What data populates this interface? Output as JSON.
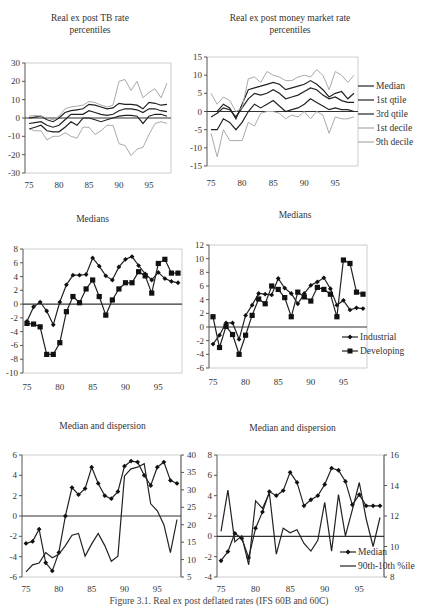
{
  "caption": "Figure 3.1.  Real ex post deflated rates (IFS 60B and 60C)",
  "chart_data": [
    {
      "id": "tb_percentiles",
      "type": "line",
      "title": "Real ex post TB rate percentiles",
      "title_lines": [
        "Real ex post TB rate",
        "percentiles"
      ],
      "x": [
        75,
        76,
        77,
        78,
        79,
        80,
        81,
        82,
        83,
        84,
        85,
        86,
        87,
        88,
        89,
        90,
        91,
        92,
        93,
        94,
        95,
        96,
        97,
        98
      ],
      "xticks": [
        75,
        80,
        85,
        90,
        95
      ],
      "yticks": [
        30,
        20,
        10,
        0,
        -10,
        -20,
        -30
      ],
      "ylim": [
        -30,
        30
      ],
      "grid": false,
      "series": [
        {
          "name": "Median",
          "color": "#222",
          "values": [
            -3,
            -2.5,
            -2,
            -4,
            -5,
            -4,
            -1,
            2,
            2,
            2,
            4,
            3,
            2,
            1.5,
            2,
            4,
            5,
            5,
            4.5,
            3,
            5,
            5,
            4,
            3.5
          ]
        },
        {
          "name": "1st qtile",
          "color": "#222",
          "values": [
            -6,
            -5,
            -4,
            -7,
            -7.5,
            -7.5,
            -5,
            -2,
            -4,
            0,
            0,
            -1,
            -2,
            -1,
            0,
            1,
            1.5,
            1.5,
            1,
            -3,
            1,
            2,
            2,
            1
          ]
        },
        {
          "name": "3rd qtile",
          "color": "#222",
          "values": [
            0,
            0.5,
            1,
            -1,
            -2,
            0,
            3,
            4,
            4.5,
            5,
            7.5,
            7,
            6,
            5,
            5.5,
            8,
            7.5,
            7.5,
            7,
            5,
            8.5,
            8,
            7,
            7.5
          ]
        },
        {
          "name": "1st decile",
          "color": "#aaa",
          "values": [
            -6,
            -7,
            -7,
            -12,
            -10,
            -10,
            -8,
            -10,
            -11,
            -5,
            -5,
            -9,
            -7,
            -4,
            -4,
            -14,
            -15,
            -20.5,
            -17,
            -16,
            -9,
            -3,
            -2,
            -3
          ]
        },
        {
          "name": "9th decile",
          "color": "#aaa",
          "values": [
            1,
            1.5,
            1,
            0,
            -1,
            1,
            5,
            6,
            6.5,
            7,
            9,
            8.5,
            7,
            6,
            7,
            20,
            21,
            15,
            20,
            11,
            14,
            16,
            11,
            19
          ]
        }
      ]
    },
    {
      "id": "mm_percentiles",
      "type": "line",
      "title": "Real ex post money market rate percentiles",
      "title_lines": [
        "Real ex post money market rate",
        "percentiles"
      ],
      "x": [
        75,
        76,
        77,
        78,
        79,
        80,
        81,
        82,
        83,
        84,
        85,
        86,
        87,
        88,
        89,
        90,
        91,
        92,
        93,
        94,
        95,
        96,
        97,
        98
      ],
      "xticks": [
        75,
        80,
        85,
        90,
        95
      ],
      "yticks": [
        15,
        10,
        5,
        0,
        -5,
        -10,
        -15
      ],
      "ylim": [
        -15,
        15
      ],
      "grid": false,
      "legend": {
        "position": "right",
        "entries": [
          "Median",
          "1st qtile",
          "3rd qtile",
          "1st decile",
          "9th decile"
        ]
      },
      "series": [
        {
          "name": "Median",
          "color": "#222",
          "values": [
            -1.5,
            -0.5,
            1,
            0.5,
            -1.5,
            1,
            3.5,
            5,
            4.5,
            5,
            6,
            5,
            3.5,
            4,
            4.5,
            5.5,
            6.5,
            6,
            4.5,
            3.5,
            4,
            3,
            2.5,
            2.5
          ]
        },
        {
          "name": "1st qtile",
          "color": "#222",
          "values": [
            -5,
            -5,
            -2,
            -3,
            -5,
            -3,
            0,
            2,
            1,
            2,
            3,
            1.5,
            0,
            0.5,
            1,
            2,
            3.5,
            2.5,
            1.5,
            0.5,
            1,
            0.5,
            0.5,
            0
          ]
        },
        {
          "name": "3rd qtile",
          "color": "#222",
          "values": [
            0,
            0,
            2,
            1,
            -2,
            2,
            6,
            6.5,
            7,
            7.5,
            8,
            7.5,
            6,
            6.5,
            7,
            7.5,
            8.5,
            7.5,
            6,
            4,
            5,
            5.5,
            3.5,
            5
          ]
        },
        {
          "name": "1st decile",
          "color": "#aaa",
          "values": [
            -6,
            -12.5,
            -5,
            -8,
            -8,
            -8,
            -3,
            -4,
            -0.5,
            0,
            0,
            -0.5,
            -2,
            -1,
            -1.5,
            0,
            -2,
            0,
            -1,
            -6,
            -1.5,
            -2,
            -2,
            -1.5
          ]
        },
        {
          "name": "9th decile",
          "color": "#aaa",
          "values": [
            5,
            2,
            4,
            3,
            0,
            1,
            9,
            9.5,
            8,
            11,
            10,
            9.5,
            8.5,
            8.5,
            9.5,
            10,
            9.5,
            11.5,
            10,
            6,
            11,
            10,
            8,
            10
          ]
        }
      ]
    },
    {
      "id": "medians_tb",
      "type": "line",
      "title": "Medians",
      "x": [
        75,
        76,
        77,
        78,
        79,
        80,
        81,
        82,
        83,
        84,
        85,
        86,
        87,
        88,
        89,
        90,
        91,
        92,
        93,
        94,
        95,
        96,
        97,
        98
      ],
      "xticks": [
        75,
        80,
        85,
        90,
        95
      ],
      "yticks": [
        8,
        6,
        4,
        2,
        0,
        -2,
        -4,
        -6,
        -8,
        -10
      ],
      "ylim": [
        -10,
        8
      ],
      "grid": false,
      "series": [
        {
          "name": "Industrial",
          "marker": "diamond",
          "color": "#222",
          "values": [
            -2.5,
            -0.4,
            0.3,
            -1,
            -3,
            0.3,
            2.8,
            4.2,
            4.2,
            4.3,
            6.7,
            5.5,
            4.1,
            3.5,
            5.4,
            6.5,
            6.9,
            5.6,
            4.4,
            3.5,
            4.6,
            3.7,
            3.3,
            3.1
          ]
        },
        {
          "name": "Developing",
          "marker": "square",
          "color": "#222",
          "values": [
            -2.8,
            -2.9,
            -3.3,
            -7.3,
            -7.3,
            -5.6,
            -1.1,
            1.1,
            0.2,
            2.2,
            3.5,
            1.1,
            -1.6,
            0.6,
            2.2,
            3.1,
            3.1,
            4.7,
            4.1,
            1.6,
            5.9,
            6.5,
            4.5,
            4.5
          ]
        }
      ]
    },
    {
      "id": "medians_mm",
      "type": "line",
      "title": "Medians",
      "x": [
        75,
        76,
        77,
        78,
        79,
        80,
        81,
        82,
        83,
        84,
        85,
        86,
        87,
        88,
        89,
        90,
        91,
        92,
        93,
        94,
        95,
        96,
        97,
        98
      ],
      "xticks": [
        75,
        80,
        85,
        90,
        95
      ],
      "yticks": [
        12,
        10,
        8,
        6,
        4,
        2,
        0,
        -2,
        -4,
        -6
      ],
      "ylim": [
        -6,
        12
      ],
      "grid": false,
      "legend": {
        "position": "inside-right",
        "entries": [
          "Industrial",
          "Developing"
        ]
      },
      "series": [
        {
          "name": "Industrial",
          "marker": "diamond",
          "color": "#222",
          "values": [
            -2.5,
            -1.2,
            0.6,
            0.6,
            -1.8,
            1.7,
            3.2,
            4.9,
            4.8,
            4.7,
            7.1,
            5.7,
            4.9,
            3.4,
            4.9,
            6.1,
            6.6,
            7.2,
            5.6,
            3.2,
            3.9,
            2.5,
            2.8,
            2.7
          ]
        },
        {
          "name": "Developing",
          "marker": "square",
          "color": "#222",
          "values": [
            1.5,
            -3,
            0.1,
            -1.1,
            -4,
            -1.2,
            1.7,
            4.1,
            3.4,
            6,
            5.5,
            4.3,
            1.5,
            5.1,
            4.4,
            3.8,
            5.8,
            5.5,
            4.8,
            1.5,
            9.8,
            9.3,
            5.1,
            4.8
          ]
        }
      ]
    },
    {
      "id": "disp_tb",
      "type": "line",
      "title": "Median and dispersion",
      "x": [
        75,
        76,
        77,
        78,
        79,
        80,
        81,
        82,
        83,
        84,
        85,
        86,
        87,
        88,
        89,
        90,
        91,
        92,
        93,
        94,
        95,
        96,
        97,
        98
      ],
      "xticks": [
        75,
        80,
        85,
        90,
        95
      ],
      "yticks_left": [
        6,
        4,
        2,
        0,
        -2,
        -4,
        -6
      ],
      "ylim_left": [
        -6,
        6
      ],
      "yticks_right": [
        40,
        35,
        30,
        25,
        20,
        15,
        10,
        5
      ],
      "ylim_right": [
        5,
        40
      ],
      "grid": false,
      "series": [
        {
          "name": "Median",
          "axis": "left",
          "marker": "diamond",
          "color": "#222",
          "values": [
            -2.7,
            -2.5,
            -1.3,
            -4.6,
            -5.4,
            -3.6,
            0,
            2.8,
            2.1,
            2.7,
            4.8,
            3.2,
            2,
            1.7,
            2.4,
            4.9,
            5.4,
            5.3,
            4,
            3,
            4.8,
            5.3,
            3.5,
            3.2
          ]
        },
        {
          "name": "90th-10th %ile",
          "axis": "right",
          "color": "#222",
          "values": [
            6.5,
            8.5,
            9,
            12,
            10.5,
            11.5,
            14,
            17,
            17.5,
            11,
            14.5,
            17.5,
            14,
            9.5,
            11,
            34,
            36,
            36.5,
            37.5,
            26,
            24,
            20,
            12,
            21.5
          ]
        }
      ]
    },
    {
      "id": "disp_mm",
      "type": "line",
      "title": "Median and dispersion",
      "x": [
        75,
        76,
        77,
        78,
        79,
        80,
        81,
        82,
        83,
        84,
        85,
        86,
        87,
        88,
        89,
        90,
        91,
        92,
        93,
        94,
        95,
        96,
        97,
        98
      ],
      "xticks": [
        75,
        80,
        85,
        90,
        95
      ],
      "yticks_left": [
        8,
        6,
        4,
        2,
        0,
        -2,
        -4
      ],
      "ylim_left": [
        -4,
        8
      ],
      "yticks_right": [
        16,
        14,
        12,
        10,
        8
      ],
      "ylim_right": [
        8,
        16
      ],
      "grid": false,
      "legend": {
        "position": "inside-right-bottom",
        "entries": [
          "Median",
          "90th-10th %ile"
        ]
      },
      "series": [
        {
          "name": "Median",
          "axis": "left",
          "marker": "diamond",
          "color": "#222",
          "values": [
            -2.4,
            -1.5,
            0.3,
            -0.2,
            -2.1,
            0.8,
            2.4,
            4.4,
            4,
            4.5,
            6.3,
            5.3,
            3,
            3.6,
            4,
            5.1,
            6.7,
            6.5,
            5.4,
            3.1,
            4.1,
            3,
            3,
            3
          ]
        },
        {
          "name": "90th-10th %ile",
          "axis": "right",
          "color": "#222",
          "values": [
            11,
            13.7,
            10.3,
            10.7,
            8.8,
            13,
            12.5,
            13.5,
            9.5,
            11.2,
            10.9,
            11.1,
            10.2,
            9.7,
            10.4,
            12.9,
            9.7,
            13.4,
            10.7,
            12.4,
            14.2,
            11.8,
            10,
            11.9
          ]
        }
      ]
    }
  ],
  "layout": {
    "panels": [
      {
        "id": "tb_percentiles",
        "title_x": 0,
        "title_w": 180,
        "title_y": 12,
        "x0": 25,
        "x1": 171,
        "y_top": 63,
        "y_bot": 173,
        "xlabel_y": 188
      },
      {
        "id": "mm_percentiles",
        "title_x": 205,
        "title_w": 170,
        "title_y": 12,
        "x0": 207,
        "x1": 358,
        "y_top": 57,
        "y_bot": 166,
        "xlabel_y": 186
      },
      {
        "id": "medians_tb",
        "title_x": 0,
        "title_w": 185,
        "title_y": 213,
        "x0": 23,
        "x1": 182,
        "y_top": 249,
        "y_bot": 373,
        "xlabel_y": 390
      },
      {
        "id": "medians_mm",
        "title_x": 205,
        "title_w": 180,
        "title_y": 209,
        "x0": 209,
        "x1": 367,
        "y_top": 245,
        "y_bot": 368,
        "xlabel_y": 385
      },
      {
        "id": "disp_tb",
        "title_x": 0,
        "title_w": 205,
        "title_y": 420,
        "x0": 22,
        "x1": 181,
        "y_top": 455,
        "y_bot": 577,
        "xlabel_y": 592
      },
      {
        "id": "disp_mm",
        "title_x": 205,
        "title_w": 175,
        "title_y": 422,
        "x0": 217,
        "x1": 384,
        "y_top": 455,
        "y_bot": 577,
        "xlabel_y": 592
      }
    ]
  }
}
